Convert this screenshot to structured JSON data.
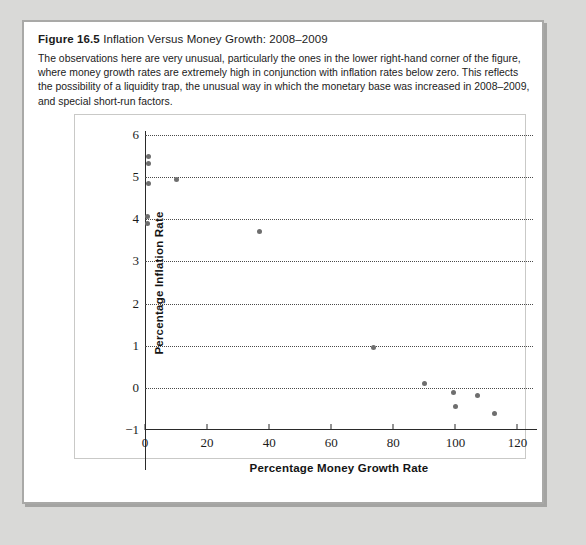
{
  "figure": {
    "label": "Figure 16.5",
    "name": "Inflation Versus Money Growth: 2008–2009",
    "description": "The observations here are very unusual, particularly the ones in the lower right-hand corner of the figure, where money growth rates are extremely high in conjunction with inflation rates below zero. This reflects the possibility of a liquidity trap, the unusual way in which the monetary base was increased in 2008–2009, and special short-run factors."
  },
  "chart_data": {
    "type": "scatter",
    "title": "Inflation Versus Money Growth: 2008–2009",
    "xlabel": "Percentage Money Growth Rate",
    "ylabel": "Percentage Inflation Rate",
    "xlim": [
      0,
      125
    ],
    "ylim": [
      -1,
      6
    ],
    "xticks": [
      0,
      20,
      40,
      60,
      80,
      100,
      120
    ],
    "yticks": [
      -1,
      0,
      1,
      2,
      3,
      4,
      5,
      6
    ],
    "grid": "horizontal-dotted",
    "legend": null,
    "marker_color": "#6e6e6e",
    "points": [
      {
        "x": 1.0,
        "y": 5.5
      },
      {
        "x": 1.0,
        "y": 5.33
      },
      {
        "x": 1.0,
        "y": 4.85
      },
      {
        "x": 10.0,
        "y": 4.95
      },
      {
        "x": 0.7,
        "y": 4.07
      },
      {
        "x": 0.7,
        "y": 3.9
      },
      {
        "x": 37.0,
        "y": 3.72
      },
      {
        "x": 73.5,
        "y": 0.95
      },
      {
        "x": 90.0,
        "y": 0.1
      },
      {
        "x": 99.5,
        "y": -0.12
      },
      {
        "x": 100.0,
        "y": -0.45
      },
      {
        "x": 107.0,
        "y": -0.18
      },
      {
        "x": 112.5,
        "y": -0.62
      }
    ]
  },
  "colors": {
    "page_background": "#d9d9d7",
    "card_background": "#ffffff",
    "card_border": "#a9a9a7",
    "axis": "#2a2a2a",
    "gridline": "#4a4a4a",
    "marker": "#6e6e6e",
    "text": "#1b1b1b"
  }
}
